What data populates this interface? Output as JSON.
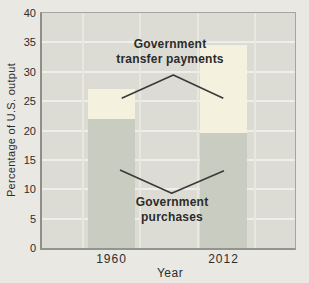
{
  "chart_data": {
    "type": "bar",
    "stacked": true,
    "title": "",
    "xlabel": "Year",
    "ylabel": "Percentage of U.S. output",
    "categories": [
      "1960",
      "2012"
    ],
    "series": [
      {
        "name": "Government purchases",
        "values": [
          22,
          19.5
        ],
        "color": "#c9ccc1"
      },
      {
        "name": "Government transfer payments",
        "values": [
          5,
          15
        ],
        "color": "#f4f2de"
      }
    ],
    "totals": [
      27,
      34.5
    ],
    "ylim": [
      0,
      40
    ],
    "yticks": [
      0,
      5,
      10,
      15,
      20,
      25,
      30,
      35,
      40
    ],
    "grid": true,
    "legend_position": "none",
    "annotations": [
      {
        "text": "Government transfer payments",
        "lines": [
          "Government",
          "transfer payments"
        ],
        "points_to": "upper (lighter) segment of each bar"
      },
      {
        "text": "Government purchases",
        "lines": [
          "Government",
          "purchases"
        ],
        "points_to": "lower (darker) segment of each bar"
      }
    ],
    "colors": {
      "page_background": "#e9e8e2",
      "plot_background": "#dcdcd5",
      "gridline": "#efefe9",
      "purchases_fill": "#c9ccc1",
      "transfers_fill": "#f4f2de",
      "axis_frame": "#8f8f89",
      "text": "#2d2d2d",
      "annotation_line": "#3a3a3a"
    }
  }
}
